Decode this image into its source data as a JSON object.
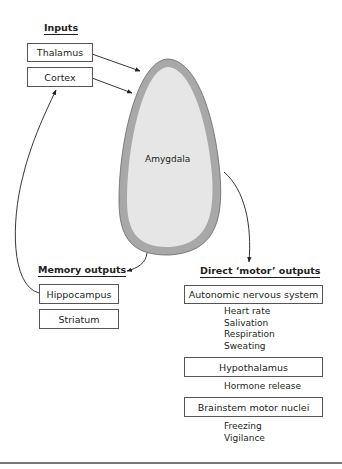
{
  "inputs": {
    "header": "Inputs",
    "boxes": [
      "Thalamus",
      "Cortex"
    ]
  },
  "amygdala": {
    "label": "Amygdala",
    "fill": "#e6e6e6",
    "rim": "#a8a8a8"
  },
  "memory_outputs": {
    "header": "Memory outputs",
    "boxes": [
      "Hippocampus",
      "Striatum"
    ]
  },
  "motor_outputs": {
    "header": "Direct ‘motor’ outputs",
    "groups": [
      {
        "box": "Autonomic nervous system",
        "effects": [
          "Heart rate",
          "Salivation",
          "Respiration",
          "Sweating"
        ]
      },
      {
        "box": "Hypothalamus",
        "effects": [
          "Hormone release"
        ]
      },
      {
        "box": "Brainstem motor nuclei",
        "effects": [
          "Freezing",
          "Vigilance"
        ]
      }
    ]
  }
}
